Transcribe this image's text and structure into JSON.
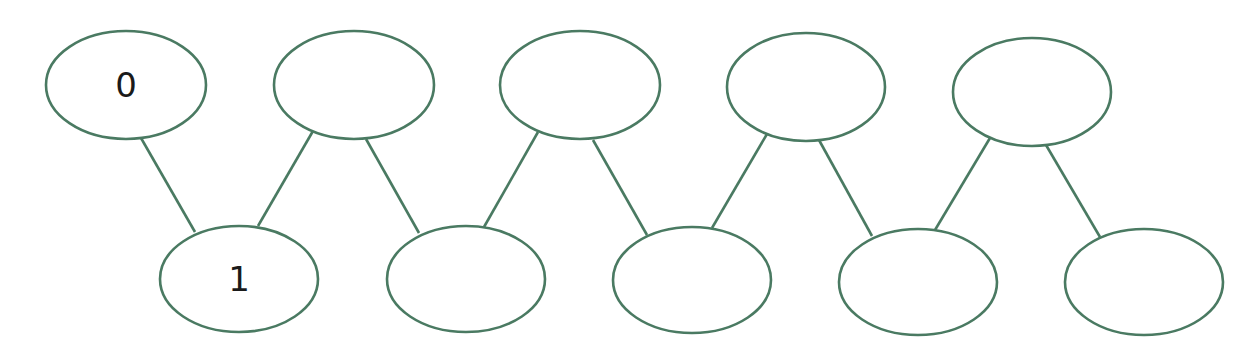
{
  "diagram": {
    "type": "zigzag-graph",
    "stroke_color": "#4a7a62",
    "background": "#ffffff",
    "nodes": [
      {
        "id": "t0",
        "row": "top",
        "cx": 126,
        "cy": 85,
        "rx": 80,
        "ry": 54,
        "label": "0"
      },
      {
        "id": "b0",
        "row": "bottom",
        "cx": 239,
        "cy": 279,
        "rx": 79,
        "ry": 53,
        "label": "1"
      },
      {
        "id": "t1",
        "row": "top",
        "cx": 354,
        "cy": 85,
        "rx": 80,
        "ry": 54,
        "label": ""
      },
      {
        "id": "b1",
        "row": "bottom",
        "cx": 466,
        "cy": 279,
        "rx": 79,
        "ry": 53,
        "label": ""
      },
      {
        "id": "t2",
        "row": "top",
        "cx": 580,
        "cy": 85,
        "rx": 80,
        "ry": 54,
        "label": ""
      },
      {
        "id": "b2",
        "row": "bottom",
        "cx": 692,
        "cy": 280,
        "rx": 79,
        "ry": 53,
        "label": ""
      },
      {
        "id": "t3",
        "row": "top",
        "cx": 806,
        "cy": 87,
        "rx": 79,
        "ry": 54,
        "label": ""
      },
      {
        "id": "b3",
        "row": "bottom",
        "cx": 918,
        "cy": 282,
        "rx": 79,
        "ry": 53,
        "label": ""
      },
      {
        "id": "t4",
        "row": "top",
        "cx": 1032,
        "cy": 92,
        "rx": 79,
        "ry": 54,
        "label": ""
      },
      {
        "id": "b4",
        "row": "bottom",
        "cx": 1144,
        "cy": 282,
        "rx": 79,
        "ry": 53,
        "label": ""
      }
    ],
    "edges": [
      {
        "from": "t0",
        "to": "b0",
        "x1": 141,
        "y1": 138,
        "x2": 195,
        "y2": 232
      },
      {
        "from": "b0",
        "to": "t1",
        "x1": 258,
        "y1": 226,
        "x2": 313,
        "y2": 131
      },
      {
        "from": "t1",
        "to": "b1",
        "x1": 366,
        "y1": 139,
        "x2": 419,
        "y2": 233
      },
      {
        "from": "b1",
        "to": "t2",
        "x1": 484,
        "y1": 227,
        "x2": 538,
        "y2": 132
      },
      {
        "from": "t2",
        "to": "b2",
        "x1": 593,
        "y1": 140,
        "x2": 647,
        "y2": 235
      },
      {
        "from": "b2",
        "to": "t3",
        "x1": 712,
        "y1": 228,
        "x2": 767,
        "y2": 134
      },
      {
        "from": "t3",
        "to": "b3",
        "x1": 819,
        "y1": 140,
        "x2": 872,
        "y2": 236
      },
      {
        "from": "b3",
        "to": "t4",
        "x1": 935,
        "y1": 230,
        "x2": 990,
        "y2": 138
      },
      {
        "from": "t4",
        "to": "b4",
        "x1": 1046,
        "y1": 145,
        "x2": 1100,
        "y2": 237
      }
    ]
  }
}
